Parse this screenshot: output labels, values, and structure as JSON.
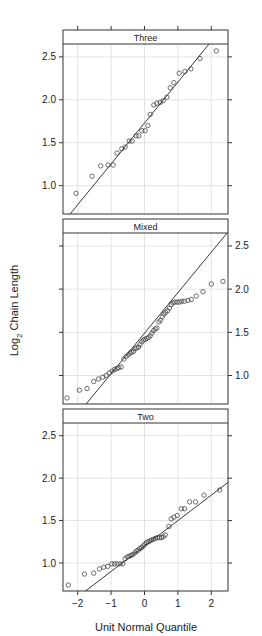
{
  "chart_data": {
    "type": "scatter",
    "subtype": "normal-qq-plot (lattice, 3 panels)",
    "xlabel": "Unit Normal Quantile",
    "ylabel": "Log2 Chain Length",
    "ylabel_parts": {
      "pre": "Log",
      "sub": "2",
      "post": " Chain Length"
    },
    "xlim": [
      -2.44,
      2.5
    ],
    "ylim": [
      0.67,
      2.65
    ],
    "x_ticks": [
      -2,
      -1,
      0,
      1,
      2
    ],
    "x_tick_labels": [
      "−2",
      "−1",
      "0",
      "1",
      "2"
    ],
    "y_ticks": [
      1.0,
      1.5,
      2.0,
      2.5
    ],
    "y_tick_labels": [
      "1.0",
      "1.5",
      "2.0",
      "2.5"
    ],
    "grid": true,
    "panels": [
      {
        "name": "Three",
        "y_axis_side": "left",
        "reference_line": {
          "slope": 0.476,
          "intercept": 1.73
        },
        "points": [
          [
            -2.05,
            0.91
          ],
          [
            -1.57,
            1.11
          ],
          [
            -1.31,
            1.23
          ],
          [
            -1.09,
            1.24
          ],
          [
            -0.94,
            1.24
          ],
          [
            -0.82,
            1.38
          ],
          [
            -0.68,
            1.43
          ],
          [
            -0.58,
            1.45
          ],
          [
            -0.46,
            1.52
          ],
          [
            -0.37,
            1.52
          ],
          [
            -0.25,
            1.58
          ],
          [
            -0.17,
            1.58
          ],
          [
            -0.08,
            1.64
          ],
          [
            0.02,
            1.64
          ],
          [
            0.1,
            1.7
          ],
          [
            0.17,
            1.83
          ],
          [
            0.28,
            1.94
          ],
          [
            0.37,
            1.96
          ],
          [
            0.47,
            1.97
          ],
          [
            0.56,
            1.99
          ],
          [
            0.67,
            2.03
          ],
          [
            0.77,
            2.14
          ],
          [
            0.88,
            2.2
          ],
          [
            1.04,
            2.31
          ],
          [
            1.21,
            2.33
          ],
          [
            1.39,
            2.36
          ],
          [
            1.66,
            2.48
          ],
          [
            2.15,
            2.57
          ]
        ]
      },
      {
        "name": "Mixed",
        "y_axis_side": "right",
        "reference_line": {
          "slope": 0.469,
          "intercept": 1.49
        },
        "points": [
          [
            -2.32,
            0.74
          ],
          [
            -1.95,
            0.83
          ],
          [
            -1.72,
            0.85
          ],
          [
            -1.52,
            0.93
          ],
          [
            -1.38,
            0.96
          ],
          [
            -1.25,
            0.98
          ],
          [
            -1.15,
            1.0
          ],
          [
            -1.05,
            1.03
          ],
          [
            -0.97,
            1.05
          ],
          [
            -0.9,
            1.07
          ],
          [
            -0.83,
            1.08
          ],
          [
            -0.77,
            1.09
          ],
          [
            -0.7,
            1.1
          ],
          [
            -0.62,
            1.19
          ],
          [
            -0.55,
            1.22
          ],
          [
            -0.48,
            1.24
          ],
          [
            -0.43,
            1.26
          ],
          [
            -0.38,
            1.27
          ],
          [
            -0.33,
            1.28
          ],
          [
            -0.28,
            1.31
          ],
          [
            -0.23,
            1.32
          ],
          [
            -0.18,
            1.33
          ],
          [
            -0.13,
            1.36
          ],
          [
            -0.08,
            1.39
          ],
          [
            -0.03,
            1.41
          ],
          [
            0.02,
            1.42
          ],
          [
            0.07,
            1.43
          ],
          [
            0.12,
            1.44
          ],
          [
            0.17,
            1.46
          ],
          [
            0.22,
            1.49
          ],
          [
            0.27,
            1.52
          ],
          [
            0.32,
            1.54
          ],
          [
            0.37,
            1.55
          ],
          [
            0.43,
            1.62
          ],
          [
            0.48,
            1.64
          ],
          [
            0.53,
            1.68
          ],
          [
            0.58,
            1.71
          ],
          [
            0.63,
            1.73
          ],
          [
            0.69,
            1.75
          ],
          [
            0.75,
            1.78
          ],
          [
            0.8,
            1.82
          ],
          [
            0.85,
            1.84
          ],
          [
            0.91,
            1.85
          ],
          [
            0.98,
            1.85
          ],
          [
            1.05,
            1.85
          ],
          [
            1.12,
            1.86
          ],
          [
            1.2,
            1.86
          ],
          [
            1.3,
            1.87
          ],
          [
            1.4,
            1.88
          ],
          [
            1.55,
            1.92
          ],
          [
            1.75,
            1.97
          ],
          [
            2.0,
            2.06
          ],
          [
            2.35,
            2.09
          ]
        ]
      },
      {
        "name": "Two",
        "y_axis_side": "left",
        "reference_line": {
          "slope": 0.3,
          "intercept": 1.2
        },
        "points": [
          [
            -2.28,
            0.74
          ],
          [
            -1.8,
            0.87
          ],
          [
            -1.52,
            0.88
          ],
          [
            -1.35,
            0.93
          ],
          [
            -1.22,
            0.95
          ],
          [
            -1.1,
            0.96
          ],
          [
            -0.98,
            0.99
          ],
          [
            -0.9,
            0.99
          ],
          [
            -0.82,
            0.99
          ],
          [
            -0.73,
            0.99
          ],
          [
            -0.65,
            0.99
          ],
          [
            -0.58,
            1.05
          ],
          [
            -0.52,
            1.07
          ],
          [
            -0.46,
            1.08
          ],
          [
            -0.4,
            1.09
          ],
          [
            -0.35,
            1.1
          ],
          [
            -0.29,
            1.12
          ],
          [
            -0.24,
            1.14
          ],
          [
            -0.19,
            1.15
          ],
          [
            -0.14,
            1.17
          ],
          [
            -0.09,
            1.18
          ],
          [
            -0.04,
            1.2
          ],
          [
            0.01,
            1.22
          ],
          [
            0.06,
            1.24
          ],
          [
            0.11,
            1.25
          ],
          [
            0.16,
            1.26
          ],
          [
            0.21,
            1.27
          ],
          [
            0.27,
            1.28
          ],
          [
            0.33,
            1.29
          ],
          [
            0.39,
            1.3
          ],
          [
            0.45,
            1.3
          ],
          [
            0.51,
            1.3
          ],
          [
            0.56,
            1.31
          ],
          [
            0.62,
            1.33
          ],
          [
            0.73,
            1.43
          ],
          [
            0.8,
            1.52
          ],
          [
            0.88,
            1.54
          ],
          [
            0.98,
            1.56
          ],
          [
            1.1,
            1.64
          ],
          [
            1.2,
            1.64
          ],
          [
            1.35,
            1.72
          ],
          [
            1.53,
            1.72
          ],
          [
            1.78,
            1.8
          ],
          [
            2.25,
            1.86
          ]
        ]
      }
    ]
  },
  "colors": {
    "panel_border": "#333333",
    "strip_bg": "#ffffff",
    "grid": "#e3e3e3",
    "points": "#333333",
    "line": "#222222",
    "text": "#222222"
  }
}
